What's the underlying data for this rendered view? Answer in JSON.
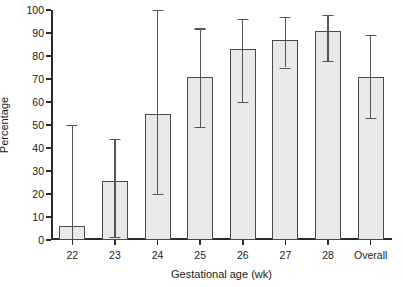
{
  "chart_data": {
    "type": "bar",
    "title": "",
    "subtitle": "",
    "xlabel": "Gestational age (wk)",
    "ylabel": "Percentage",
    "categories": [
      "22",
      "23",
      "24",
      "25",
      "26",
      "27",
      "28",
      "Overall"
    ],
    "values": [
      6,
      25.5,
      55,
      71,
      83,
      87,
      91,
      71
    ],
    "error_bars": {
      "type": "confidence-interval",
      "lower": [
        0,
        1.5,
        20,
        49,
        60,
        75,
        78,
        53
      ],
      "upper": [
        50,
        44,
        100,
        92,
        96,
        97,
        98,
        89
      ]
    },
    "series": [
      {
        "name": "Percentage",
        "values": [
          6,
          25.5,
          55,
          71,
          83,
          87,
          91,
          71
        ]
      }
    ],
    "ylim": [
      0,
      100
    ],
    "yticks": [
      0,
      10,
      20,
      30,
      40,
      50,
      60,
      70,
      80,
      90,
      100
    ],
    "ytick_labels": [
      "0",
      "10",
      "20",
      "30",
      "40",
      "50",
      "60",
      "70",
      "80",
      "90",
      "100"
    ],
    "xtick_labels": [
      "22",
      "23",
      "24",
      "25",
      "26",
      "27",
      "28",
      "Overall"
    ],
    "grid": false,
    "legend": null,
    "legend_position": "none",
    "bar_fill_color": "#e9e9e9",
    "bar_edge_color": "#4a4a4a",
    "error_bar_color": "#555555",
    "axis_color": "#2b2b2b",
    "background_color": "#ffffff"
  }
}
